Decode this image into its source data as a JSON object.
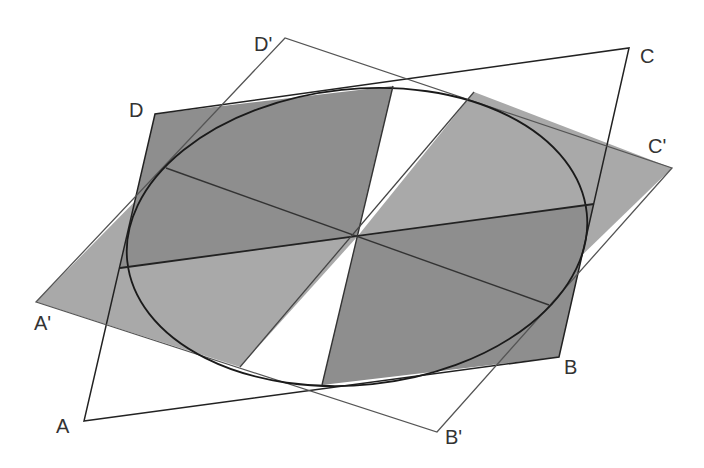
{
  "diagram": {
    "colors": {
      "background": "#ffffff",
      "dark_fill": "#8e8e8e",
      "light_fill": "#a9a9a9",
      "line_dark": "#222222",
      "line_gray": "#555555",
      "label": "#333333"
    },
    "labels": {
      "A": "A",
      "B": "B",
      "C": "C",
      "D": "D",
      "A_prime": "A'",
      "B_prime": "B'",
      "C_prime": "C'",
      "D_prime": "D'"
    },
    "points": {
      "A": [
        84,
        421
      ],
      "B": [
        559,
        357
      ],
      "C": [
        629,
        48
      ],
      "D": [
        155,
        114
      ],
      "A_prime": [
        36,
        302
      ],
      "B_prime": [
        437,
        432
      ],
      "C_prime": [
        672,
        168
      ],
      "D_prime": [
        285,
        38
      ],
      "O": [
        357,
        237
      ]
    },
    "ellipse": {
      "cx": 357,
      "cy": 237,
      "rx": 231,
      "ry": 148,
      "rotation_deg": -6
    }
  }
}
